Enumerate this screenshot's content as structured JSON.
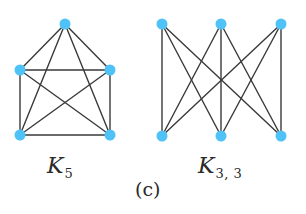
{
  "figure": {
    "caption": "(c)",
    "node_color": "#4FC3F7",
    "edge_color": "#3a3a3a",
    "node_radius": 5.5,
    "edge_width": 1.4
  },
  "graphs": [
    {
      "id": "k5",
      "label_main": "K",
      "label_sub": "5",
      "nodes": [
        {
          "id": "top",
          "x": 65,
          "y": 24
        },
        {
          "id": "mid-left",
          "x": 20,
          "y": 70
        },
        {
          "id": "mid-right",
          "x": 110,
          "y": 70
        },
        {
          "id": "bottom-left",
          "x": 20,
          "y": 135
        },
        {
          "id": "bottom-right",
          "x": 110,
          "y": 135
        }
      ],
      "edges": [
        [
          "top",
          "mid-left"
        ],
        [
          "top",
          "mid-right"
        ],
        [
          "top",
          "bottom-left"
        ],
        [
          "top",
          "bottom-right"
        ],
        [
          "mid-left",
          "mid-right"
        ],
        [
          "mid-left",
          "bottom-left"
        ],
        [
          "mid-left",
          "bottom-right"
        ],
        [
          "mid-right",
          "bottom-left"
        ],
        [
          "mid-right",
          "bottom-right"
        ],
        [
          "bottom-left",
          "bottom-right"
        ]
      ]
    },
    {
      "id": "k33",
      "label_main": "K",
      "label_sub": "3, 3",
      "nodes": [
        {
          "id": "a1",
          "x": 162,
          "y": 24
        },
        {
          "id": "a2",
          "x": 221,
          "y": 24
        },
        {
          "id": "a3",
          "x": 281,
          "y": 24
        },
        {
          "id": "b1",
          "x": 162,
          "y": 136
        },
        {
          "id": "b2",
          "x": 221,
          "y": 136
        },
        {
          "id": "b3",
          "x": 281,
          "y": 136
        }
      ],
      "edges": [
        [
          "a1",
          "b1"
        ],
        [
          "a1",
          "b2"
        ],
        [
          "a1",
          "b3"
        ],
        [
          "a2",
          "b1"
        ],
        [
          "a2",
          "b2"
        ],
        [
          "a2",
          "b3"
        ],
        [
          "a3",
          "b1"
        ],
        [
          "a3",
          "b2"
        ],
        [
          "a3",
          "b3"
        ]
      ]
    }
  ]
}
